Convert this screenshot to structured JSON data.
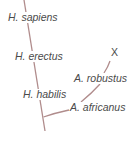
{
  "diagram": {
    "type": "phylogenetic-tree",
    "line_color": "#b08c8c",
    "text_color": "#4a4a4a",
    "taxa": [
      {
        "id": "h_sapiens",
        "label": "H. sapiens"
      },
      {
        "id": "h_erectus",
        "label": "H. erectus"
      },
      {
        "id": "extinct_marker",
        "label": "X"
      },
      {
        "id": "a_robustus",
        "label": "A. robustus"
      },
      {
        "id": "h_habilis",
        "label": "H. habilis"
      },
      {
        "id": "a_africanus",
        "label": "A. africanus"
      }
    ]
  }
}
